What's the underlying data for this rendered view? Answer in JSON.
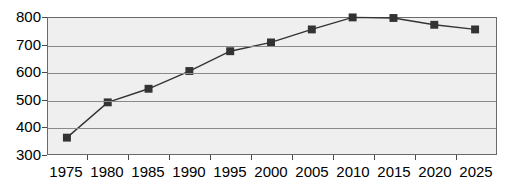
{
  "chart_data": {
    "type": "line",
    "title": "",
    "subtitle": "",
    "xlabel": "",
    "ylabel": "",
    "categories": [
      "1975",
      "1980",
      "1985",
      "1990",
      "1995",
      "2000",
      "2005",
      "2010",
      "2015",
      "2020",
      "2025"
    ],
    "values": [
      360,
      490,
      540,
      605,
      678,
      710,
      758,
      802,
      800,
      775,
      758
    ],
    "series": [
      {
        "name": "",
        "values": [
          360,
          490,
          540,
          605,
          678,
          710,
          758,
          802,
          800,
          775,
          758
        ]
      }
    ],
    "ylim": [
      300,
      800
    ],
    "y_ticks": [
      300,
      400,
      500,
      600,
      700,
      800
    ],
    "grid": true,
    "legend": "none",
    "marker": "square",
    "marker_color": "#333333",
    "line_color": "#333333",
    "plot_background": "#efefef",
    "axis_color": "#6a6a6a",
    "gridline_color": "#8a8a8a",
    "annotations": []
  }
}
